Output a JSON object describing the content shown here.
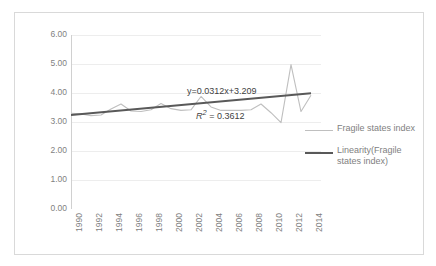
{
  "chart_data": {
    "type": "line",
    "title": "",
    "xlabel": "",
    "ylabel": "",
    "ylim": [
      0.0,
      6.0
    ],
    "ytick_step": 1.0,
    "ytick_labels": [
      "6.00",
      "5.00",
      "4.00",
      "3.00",
      "2.00",
      "1.00",
      "0.00"
    ],
    "ytick_values": [
      6.0,
      5.0,
      4.0,
      3.0,
      2.0,
      1.0,
      0.0
    ],
    "xtick_labels": [
      "1990",
      "1992",
      "1994",
      "1996",
      "1998",
      "2000",
      "2002",
      "2004",
      "2006",
      "2008",
      "2010",
      "2012",
      "2014"
    ],
    "xtick_values": [
      1990,
      1992,
      1994,
      1996,
      1998,
      2000,
      2002,
      2004,
      2006,
      2008,
      2010,
      2012,
      2014
    ],
    "xlim": [
      1990,
      2015
    ],
    "grid": "horizontal",
    "legend_position": "right",
    "series": [
      {
        "name": "Fragile states index",
        "color": "#bfbfbf",
        "x": [
          1990,
          1991,
          1992,
          1993,
          1994,
          1995,
          1996,
          1997,
          1998,
          1999,
          2000,
          2001,
          2002,
          2003,
          2004,
          2005,
          2006,
          2007,
          2008,
          2009,
          2010,
          2011,
          2012,
          2013,
          2014
        ],
        "values": [
          3.3,
          3.28,
          3.22,
          3.24,
          3.45,
          3.62,
          3.38,
          3.36,
          3.42,
          3.64,
          3.46,
          3.4,
          3.42,
          3.88,
          3.52,
          3.4,
          3.4,
          3.4,
          3.42,
          3.62,
          3.32,
          2.98,
          4.98,
          3.36,
          3.92
        ]
      },
      {
        "name": "Linearity(Fragile states index)",
        "color": "#595959",
        "x": [
          1990,
          2014
        ],
        "values": [
          3.24,
          3.99
        ]
      }
    ],
    "annotations": [
      {
        "name": "trendline-equation",
        "text": "y=0.0312x+3.209"
      },
      {
        "name": "r-squared",
        "text_italic": "R",
        "text_sup": "2",
        "text_rest": " = 0.3612",
        "text": "R² = 0.3612"
      }
    ]
  },
  "legend": {
    "items": [
      {
        "label": "Fragile states index"
      },
      {
        "label": "Linearity(Fragile states index)"
      }
    ]
  }
}
